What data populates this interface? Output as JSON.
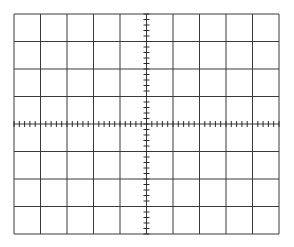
{
  "graticule": {
    "left": 14,
    "top": 14,
    "width": 265,
    "height": 220,
    "columns": 10,
    "rows": 8,
    "minor_ticks_per_division": 5,
    "line_color": "#3a3a3a",
    "tick_color": "#2a2a2a",
    "background": "#ffffff"
  }
}
